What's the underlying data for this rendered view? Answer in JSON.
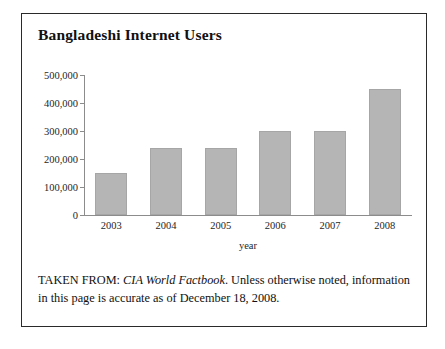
{
  "figure": {
    "title": "Bangladeshi Internet Users",
    "caption_prefix": "TAKEN FROM: ",
    "caption_source": "CIA World Factbook",
    "caption_rest": ". Unless otherwise noted, information in this page is accurate as of December 18, 2008.",
    "border_color": "#2a2a2a",
    "background_color": "#ffffff"
  },
  "chart_data": {
    "type": "bar",
    "title": "Bangladeshi Internet Users",
    "categories": [
      "2003",
      "2004",
      "2005",
      "2006",
      "2007",
      "2008"
    ],
    "values": [
      150000,
      240000,
      240000,
      300000,
      300000,
      450000
    ],
    "xlabel": "year",
    "ylabel": "",
    "ylim": [
      0,
      500000
    ],
    "yticks": [
      0,
      100000,
      200000,
      300000,
      400000,
      500000
    ],
    "ytick_labels": [
      "0",
      "100,000",
      "200,000",
      "300,000",
      "400,000",
      "500,000"
    ],
    "grid": false,
    "legend": false,
    "bar_color": "#b5b5b5",
    "axis_color": "#8c8c8c"
  }
}
